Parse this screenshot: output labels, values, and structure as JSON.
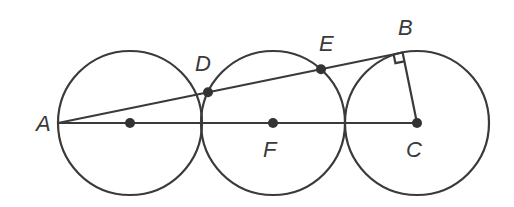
{
  "diagram": {
    "colors": {
      "stroke": "#3a3a3a",
      "background": "#ffffff"
    },
    "circles": [
      {
        "name": "left-circle",
        "cx": 130,
        "cy": 123,
        "r": 72
      },
      {
        "name": "middle-circle",
        "cx": 273,
        "cy": 123,
        "r": 72
      },
      {
        "name": "right-circle",
        "cx": 417,
        "cy": 123,
        "r": 72
      }
    ],
    "points": {
      "A": {
        "label": "A",
        "x": 58,
        "y": 123
      },
      "B": {
        "label": "B",
        "x": 402,
        "y": 52
      },
      "C": {
        "label": "C",
        "x": 417,
        "y": 123
      },
      "D": {
        "label": "D",
        "x": 208,
        "y": 92
      },
      "E": {
        "label": "E",
        "x": 321,
        "y": 69
      },
      "F": {
        "label": "F",
        "x": 273,
        "y": 123
      },
      "left_center": {
        "label": "",
        "x": 130,
        "y": 123
      }
    },
    "segments": [
      "AC",
      "AB",
      "BC"
    ],
    "right_angle_at": "B"
  }
}
